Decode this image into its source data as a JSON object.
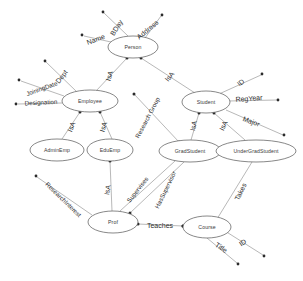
{
  "diagram": {
    "kind": "entity-relationship-diagram",
    "background_color": "#ffffff",
    "stroke_color": "#888888",
    "text_color": "#2e2e2e",
    "entities": [
      {
        "id": "person",
        "label": "Person",
        "cx": 133,
        "cy": 47,
        "rx": 25,
        "ry": 11
      },
      {
        "id": "employee",
        "label": "Employee",
        "cx": 90,
        "cy": 101,
        "rx": 28,
        "ry": 11
      },
      {
        "id": "student",
        "label": "Student",
        "cx": 206,
        "cy": 102,
        "rx": 24,
        "ry": 11
      },
      {
        "id": "adminemp",
        "label": "AdminEmp",
        "cx": 57,
        "cy": 150,
        "rx": 27,
        "ry": 11
      },
      {
        "id": "eduemp",
        "label": "EduEmp",
        "cx": 110,
        "cy": 150,
        "rx": 23,
        "ry": 11
      },
      {
        "id": "gradstudent",
        "label": "GradStudent",
        "cx": 190,
        "cy": 151,
        "rx": 31,
        "ry": 11
      },
      {
        "id": "undergradstudent",
        "label": "UnderGradStudent",
        "cx": 256,
        "cy": 151,
        "rx": 40,
        "ry": 11
      },
      {
        "id": "prof",
        "label": "Prof",
        "cx": 113,
        "cy": 222,
        "rx": 25,
        "ry": 11
      },
      {
        "id": "course",
        "label": "Course",
        "cx": 207,
        "cy": 227,
        "rx": 24,
        "ry": 11
      }
    ],
    "attributes": [
      {
        "id": "person-bday",
        "label": "BDay",
        "owner": "person",
        "dot_x": 103,
        "dot_y": 12,
        "label_x": 117,
        "label_y": 28,
        "rotate": -58
      },
      {
        "id": "person-address",
        "label": "Address",
        "owner": "person",
        "dot_x": 162,
        "dot_y": 15,
        "label_x": 148,
        "label_y": 30,
        "rotate": -40
      },
      {
        "id": "person-name",
        "label": "Name",
        "owner": "person",
        "dot_x": 82,
        "dot_y": 35,
        "label_x": 96,
        "label_y": 40,
        "rotate": -20
      },
      {
        "id": "employee-dept",
        "label": "Dept",
        "owner": "employee",
        "dot_x": 45,
        "dot_y": 61,
        "label_x": 62,
        "label_y": 77,
        "rotate": -52
      },
      {
        "id": "employee-joiningdate",
        "label": "JoiningDate",
        "owner": "employee",
        "dot_x": 19,
        "dot_y": 80,
        "label_x": 42,
        "label_y": 89,
        "rotate": -20
      },
      {
        "id": "employee-designation",
        "label": "Designation",
        "owner": "employee",
        "dot_x": 16,
        "dot_y": 104,
        "label_x": 41,
        "label_y": 103,
        "rotate": -3
      },
      {
        "id": "student-id",
        "label": "ID",
        "owner": "student",
        "dot_x": 262,
        "dot_y": 74,
        "label_x": 241,
        "label_y": 83,
        "rotate": -38
      },
      {
        "id": "student-regyear",
        "label": "RegYear",
        "owner": "student",
        "dot_x": 278,
        "dot_y": 100,
        "label_x": 249,
        "label_y": 99,
        "rotate": -4
      },
      {
        "id": "student-major",
        "label": "Major",
        "owner": "student",
        "dot_x": 284,
        "dot_y": 135,
        "label_x": 251,
        "label_y": 122,
        "rotate": 20
      },
      {
        "id": "prof-researchinterest",
        "label": "ResearchInterest",
        "owner": "prof",
        "dot_x": 36,
        "dot_y": 176,
        "label_x": 63,
        "label_y": 200,
        "rotate": 44
      },
      {
        "id": "course-id",
        "label": "ID",
        "owner": "course",
        "dot_x": 264,
        "dot_y": 256,
        "label_x": 243,
        "label_y": 243,
        "rotate": -35
      },
      {
        "id": "course-title",
        "label": "Title",
        "owner": "course",
        "dot_x": 238,
        "dot_y": 264,
        "label_x": 221,
        "label_y": 248,
        "rotate": 34
      }
    ],
    "relationships": [
      {
        "id": "person-employee-isa",
        "label": "IsA",
        "from": "person",
        "to": "employee",
        "label_x": 110,
        "label_y": 76,
        "rotate": -72
      },
      {
        "id": "person-student-isa",
        "label": "IsA",
        "from": "person",
        "to": "student",
        "label_x": 170,
        "label_y": 77,
        "rotate": -52
      },
      {
        "id": "employee-adminemp-isa",
        "label": "IsA",
        "from": "employee",
        "to": "adminemp",
        "label_x": 72,
        "label_y": 127,
        "rotate": -68
      },
      {
        "id": "employee-eduemp-isa",
        "label": "IsA",
        "from": "employee",
        "to": "eduemp",
        "label_x": 104,
        "label_y": 127,
        "rotate": -72
      },
      {
        "id": "student-gradstudent-isa",
        "label": "IsA",
        "from": "student",
        "to": "gradstudent",
        "label_x": 194,
        "label_y": 126,
        "rotate": -78
      },
      {
        "id": "student-undergrad-isa",
        "label": "IsA",
        "from": "student",
        "to": "undergradstudent",
        "label_x": 224,
        "label_y": 126,
        "rotate": -64
      },
      {
        "id": "eduemp-prof-isa",
        "label": "IsA",
        "from": "eduemp",
        "to": "prof",
        "label_x": 108,
        "label_y": 190,
        "rotate": -80
      },
      {
        "id": "gradstudent-research-group",
        "label": "Research Group",
        "from": "gradstudent",
        "to": "researchgroup-dot",
        "label_x": 148,
        "label_y": 118,
        "rotate": -62
      },
      {
        "id": "prof-supervises",
        "label": "Supervises",
        "from": "prof",
        "to": "gradstudent",
        "label_x": 138,
        "label_y": 190,
        "rotate": -52
      },
      {
        "id": "gradstudent-hassupervisor",
        "label": "HasSupervisor",
        "from": "gradstudent",
        "to": "prof",
        "label_x": 166,
        "label_y": 190,
        "rotate": -64
      },
      {
        "id": "prof-teaches-course",
        "label": "Teaches",
        "from": "prof",
        "to": "course",
        "label_x": 160,
        "label_y": 226,
        "rotate": 0
      },
      {
        "id": "undergrad-takes-course",
        "label": "Takes",
        "from": "undergradstudent",
        "to": "course",
        "label_x": 241,
        "label_y": 192,
        "rotate": -64
      }
    ],
    "edges": [
      {
        "id": "edge-person-bday",
        "x1": 128,
        "y1": 36,
        "x2": 104,
        "y2": 13
      },
      {
        "id": "edge-person-address",
        "x1": 145,
        "y1": 38,
        "x2": 161,
        "y2": 16
      },
      {
        "id": "edge-person-name",
        "x1": 111,
        "y1": 42,
        "x2": 84,
        "y2": 36
      },
      {
        "id": "edge-person-employee",
        "x1": 127,
        "y1": 58,
        "x2": 96,
        "y2": 91
      },
      {
        "id": "edge-person-student",
        "x1": 141,
        "y1": 58,
        "x2": 195,
        "y2": 93
      },
      {
        "id": "edge-employee-dept",
        "x1": 77,
        "y1": 92,
        "x2": 46,
        "y2": 62
      },
      {
        "id": "edge-employee-joiningdate",
        "x1": 64,
        "y1": 96,
        "x2": 21,
        "y2": 81
      },
      {
        "id": "edge-employee-designation",
        "x1": 62,
        "y1": 103,
        "x2": 18,
        "y2": 104
      },
      {
        "id": "edge-employee-adminemp",
        "x1": 80,
        "y1": 112,
        "x2": 62,
        "y2": 139
      },
      {
        "id": "edge-employee-eduemp",
        "x1": 100,
        "y1": 112,
        "x2": 112,
        "y2": 139
      },
      {
        "id": "edge-student-id",
        "x1": 219,
        "y1": 94,
        "x2": 261,
        "y2": 75
      },
      {
        "id": "edge-student-regyear",
        "x1": 228,
        "y1": 101,
        "x2": 277,
        "y2": 100
      },
      {
        "id": "edge-student-major",
        "x1": 226,
        "y1": 110,
        "x2": 283,
        "y2": 135
      },
      {
        "id": "edge-student-gradstudent",
        "x1": 199,
        "y1": 113,
        "x2": 191,
        "y2": 140
      },
      {
        "id": "edge-student-undergrad",
        "x1": 214,
        "y1": 113,
        "x2": 245,
        "y2": 140
      },
      {
        "id": "edge-gradstudent-group",
        "x1": 179,
        "y1": 142,
        "x2": 134,
        "y2": 94
      },
      {
        "id": "edge-eduemp-prof",
        "x1": 110,
        "y1": 161,
        "x2": 112,
        "y2": 211
      },
      {
        "id": "edge-prof-researchinterest",
        "x1": 92,
        "y1": 215,
        "x2": 37,
        "y2": 177
      },
      {
        "id": "edge-prof-supervises",
        "x1": 120,
        "y1": 211,
        "x2": 175,
        "y2": 161
      },
      {
        "id": "edge-prof-hassupervisor",
        "x1": 130,
        "y1": 213,
        "x2": 184,
        "y2": 162
      },
      {
        "id": "edge-prof-course",
        "x1": 138,
        "y1": 224,
        "x2": 183,
        "y2": 226
      },
      {
        "id": "edge-undergrad-course",
        "x1": 252,
        "y1": 162,
        "x2": 217,
        "y2": 219
      },
      {
        "id": "edge-course-id",
        "x1": 225,
        "y1": 231,
        "x2": 263,
        "y2": 255
      },
      {
        "id": "edge-course-title",
        "x1": 207,
        "y1": 238,
        "x2": 237,
        "y2": 263
      }
    ],
    "node_dots": [
      {
        "id": "dot-person-isa-employee",
        "x": 127,
        "y": 58
      },
      {
        "id": "dot-person-isa-student",
        "x": 141,
        "y": 58
      },
      {
        "id": "dot-person-group-anchor",
        "x": 134,
        "y": 94
      },
      {
        "id": "dot-employee-isa-admin",
        "x": 80,
        "y": 112
      },
      {
        "id": "dot-employee-isa-edu",
        "x": 100,
        "y": 112
      },
      {
        "id": "dot-student-isa-grad",
        "x": 199,
        "y": 113
      },
      {
        "id": "dot-student-isa-under",
        "x": 214,
        "y": 113
      },
      {
        "id": "dot-student-left-anchor",
        "x": 187,
        "y": 104
      },
      {
        "id": "dot-gradstudent-anchor",
        "x": 179,
        "y": 142
      },
      {
        "id": "dot-eduemp-bottom",
        "x": 110,
        "y": 161
      },
      {
        "id": "dot-prof-top",
        "x": 130,
        "y": 213
      },
      {
        "id": "dot-prof-right",
        "x": 138,
        "y": 224
      },
      {
        "id": "dot-course-left",
        "x": 183,
        "y": 226
      },
      {
        "id": "dot-course-right",
        "x": 225,
        "y": 231
      },
      {
        "id": "dot-teaches-mid",
        "x": 183,
        "y": 226
      }
    ]
  }
}
